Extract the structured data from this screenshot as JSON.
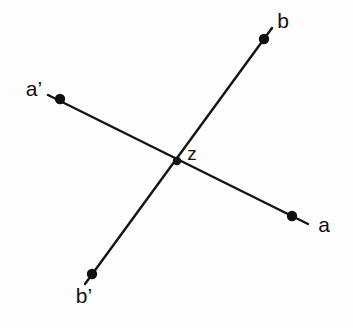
{
  "figure": {
    "background_color": "#fdfdfd",
    "stroke_color": "#141414",
    "dot_color": "#101010",
    "width": 353,
    "height": 328
  },
  "chart_data": {
    "type": "scatter",
    "title": "",
    "xlabel": "",
    "ylabel": "",
    "grid": false,
    "legend": "none",
    "xlim": [
      0,
      353
    ],
    "ylim": [
      328,
      0
    ],
    "points": [
      {
        "id": "b",
        "label": "b",
        "x": 264,
        "y": 39,
        "label_x": 283,
        "label_y": 22
      },
      {
        "id": "a-prime",
        "label": "a’",
        "x": 60,
        "y": 99,
        "label_x": 34,
        "label_y": 90
      },
      {
        "id": "z",
        "label": "z",
        "x": 177,
        "y": 161,
        "label_x": 192,
        "label_y": 155
      },
      {
        "id": "a",
        "label": "a",
        "x": 292,
        "y": 216,
        "label_x": 324,
        "label_y": 226
      },
      {
        "id": "b-prime",
        "label": "b’",
        "x": 92,
        "y": 274,
        "label_x": 84,
        "label_y": 297
      }
    ],
    "segments": [
      {
        "id": "line-a-prime-a",
        "from": [
          48,
          95
        ],
        "to": [
          308,
          224
        ],
        "label": "a’ a"
      },
      {
        "id": "line-b-prime-b",
        "from": [
          85,
          284
        ],
        "to": [
          272,
          28
        ],
        "label": "b’ b"
      }
    ]
  }
}
